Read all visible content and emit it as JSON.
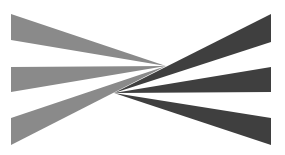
{
  "diagram": {
    "colors": {
      "background": "#ffffff",
      "light_rays": "#8a8a8a",
      "dark_rays": "#3f3f3f"
    },
    "light_fan": {
      "apex": [
        166,
        66
      ],
      "rays": [
        {
          "name": "left-ray-top",
          "base_x": 11,
          "base_top": 14,
          "base_bottom": 40
        },
        {
          "name": "left-ray-middle",
          "base_x": 11,
          "base_top": 67,
          "base_bottom": 92
        },
        {
          "name": "left-ray-bottom",
          "base_x": 11,
          "base_top": 118,
          "base_bottom": 145
        }
      ]
    },
    "dark_fan": {
      "apex": [
        114,
        93
      ],
      "rays": [
        {
          "name": "right-ray-top",
          "base_x": 271,
          "base_top": 14,
          "base_bottom": 42
        },
        {
          "name": "right-ray-middle",
          "base_x": 271,
          "base_top": 67,
          "base_bottom": 92
        },
        {
          "name": "right-ray-bottom",
          "base_x": 271,
          "base_top": 118,
          "base_bottom": 145
        }
      ]
    }
  }
}
